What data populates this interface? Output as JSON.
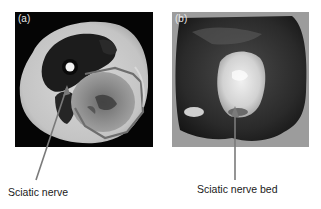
{
  "figure": {
    "panels": [
      {
        "label": "(a)",
        "description": "Axial MRI of thigh with outlined tumor region"
      },
      {
        "label": "(b)",
        "description": "Gross surgical specimen"
      }
    ],
    "annotations": [
      {
        "text": "Sciatic nerve",
        "panel": "(a)"
      },
      {
        "text": "Sciatic nerve bed",
        "panel": "(b)"
      }
    ],
    "colors": {
      "arrow": "#7a7a7a",
      "outline": "#6e6e6e",
      "text": "#1a1a1a"
    }
  }
}
